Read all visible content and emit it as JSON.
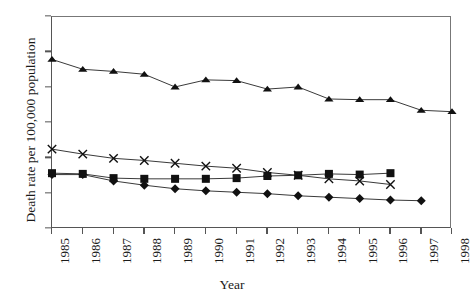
{
  "figure": {
    "clipped_title": "",
    "background_color": "#ffffff",
    "line_color": "#3a3a3a",
    "axis_color": "#555555",
    "marker_color": "#111111"
  },
  "chart_data": {
    "type": "line",
    "title": "",
    "xlabel": "Year",
    "ylabel": "Death rate per 100,000 population",
    "xlim": [
      1985,
      1998
    ],
    "ylim": [
      0,
      30
    ],
    "yticks": [
      0,
      5,
      10,
      15,
      20,
      25,
      30
    ],
    "ytick_labels": [
      "0",
      "5",
      "10",
      "15",
      "20",
      "25",
      "30"
    ],
    "xticks": [
      1985,
      1986,
      1987,
      1988,
      1989,
      1990,
      1991,
      1992,
      1993,
      1994,
      1995,
      1996,
      1997,
      1998
    ],
    "xtick_labels": [
      "1985",
      "1986",
      "1987",
      "1988",
      "1989",
      "1990",
      "1991",
      "1992",
      "1993",
      "1994",
      "1995",
      "1996",
      "1997",
      "1998"
    ],
    "xtick_rotation": 90,
    "grid": false,
    "legend": false,
    "legend_position": "none",
    "series": [
      {
        "name": "series-triangle",
        "marker": "triangle",
        "x": [
          1985,
          1986,
          1987,
          1988,
          1989,
          1990,
          1991,
          1992,
          1993,
          1994,
          1995,
          1996,
          1997,
          1998
        ],
        "values": [
          24.0,
          22.6,
          22.3,
          21.9,
          20.1,
          21.1,
          21.0,
          19.8,
          20.1,
          18.4,
          18.3,
          18.3,
          16.8,
          16.6
        ]
      },
      {
        "name": "series-cross",
        "marker": "x",
        "x": [
          1985,
          1986,
          1987,
          1988,
          1989,
          1990,
          1991,
          1992,
          1993,
          1994,
          1995,
          1996
        ],
        "values": [
          11.3,
          10.6,
          10.0,
          9.7,
          9.3,
          8.9,
          8.6,
          8.0,
          7.6,
          7.1,
          6.8,
          6.3
        ]
      },
      {
        "name": "series-square",
        "marker": "square",
        "x": [
          1985,
          1986,
          1987,
          1988,
          1989,
          1990,
          1991,
          1992,
          1993,
          1994,
          1995,
          1996
        ],
        "values": [
          7.9,
          7.8,
          7.2,
          7.1,
          7.1,
          7.1,
          7.2,
          7.5,
          7.6,
          7.8,
          7.7,
          7.9
        ]
      },
      {
        "name": "series-diamond",
        "marker": "diamond",
        "x": [
          1985,
          1986,
          1987,
          1988,
          1989,
          1990,
          1991,
          1992,
          1993,
          1994,
          1995,
          1996,
          1997
        ],
        "values": [
          7.7,
          7.7,
          6.8,
          6.2,
          5.7,
          5.4,
          5.2,
          5.0,
          4.7,
          4.5,
          4.3,
          4.1,
          4.0
        ]
      }
    ]
  }
}
